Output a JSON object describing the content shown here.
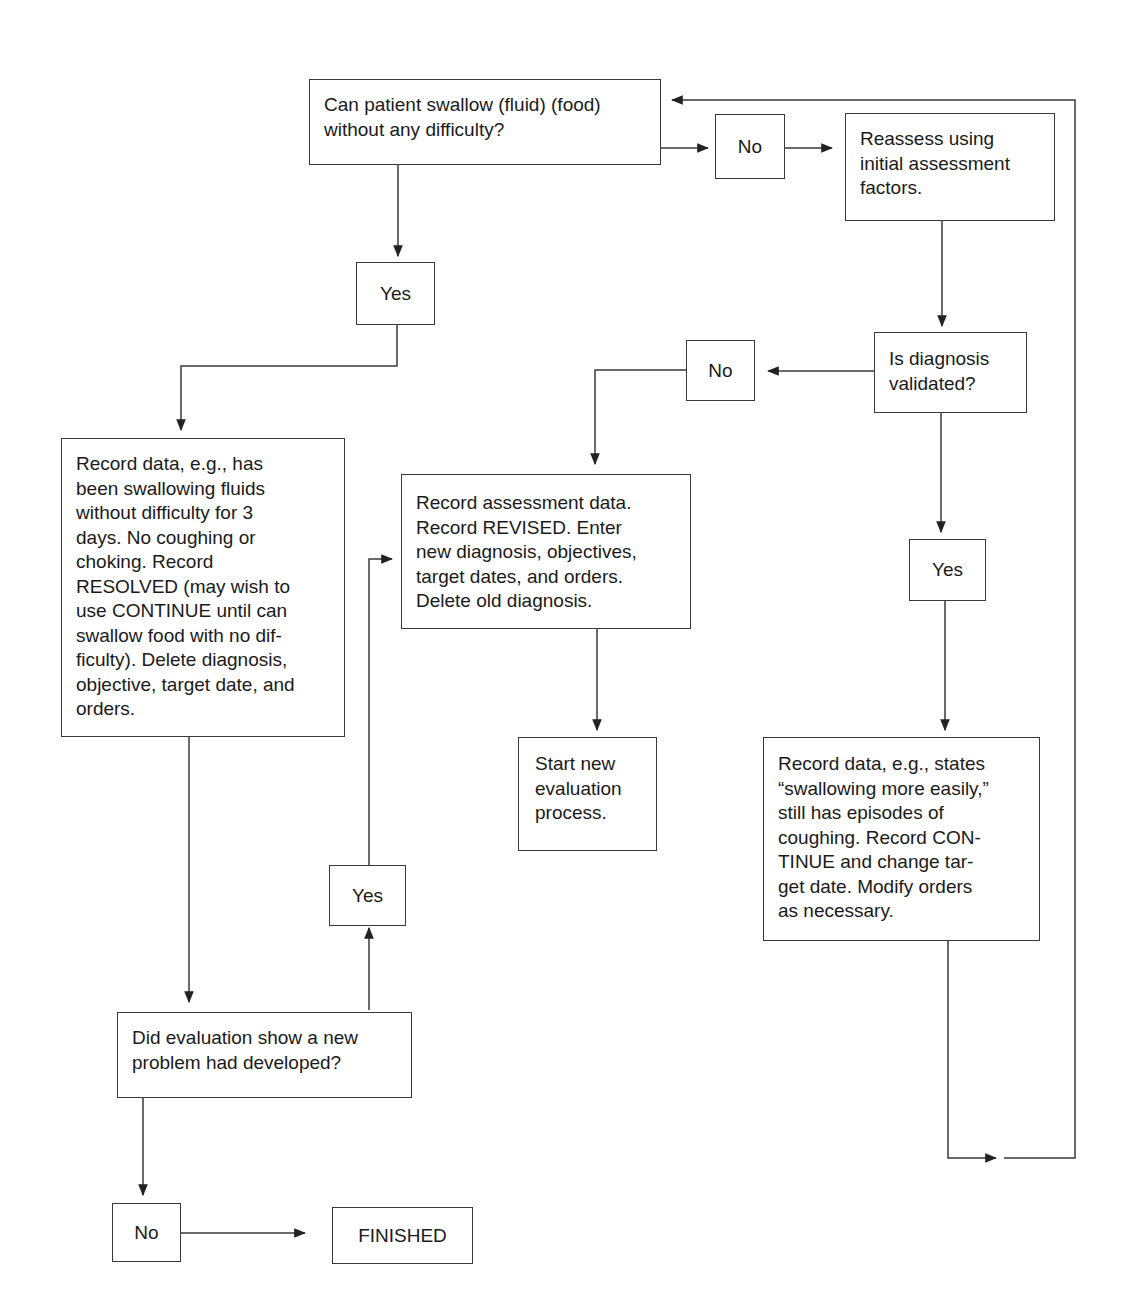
{
  "diagram": {
    "type": "flowchart",
    "topic": "Evaluation of swallowing difficulty nursing diagnosis",
    "nodes": {
      "q_swallow": "Can patient swallow (fluid) (food)\nwithout any difficulty?",
      "no_1": "No",
      "reassess": "Reassess using\ninitial assessment\nfactors.",
      "yes_1": "Yes",
      "q_validated": "Is diagnosis\nvalidated?",
      "no_2": "No",
      "record_resolved": "Record data, e.g., has\nbeen swallowing fluids\nwithout difficulty for 3\ndays. No coughing or\nchoking. Record\nRESOLVED (may wish to\nuse CONTINUE until can\nswallow food with no dif-\nficulty). Delete diagnosis,\nobjective, target date, and\norders.",
      "record_revised": "Record assessment data.\nRecord REVISED. Enter\nnew diagnosis, objectives,\ntarget dates, and orders.\nDelete old diagnosis.",
      "yes_2": "Yes",
      "start_new": "Start new\nevaluation\nprocess.",
      "record_continue": "Record data, e.g., states\n“swallowing more easily,”\nstill has episodes of\ncoughing. Record CON-\nTINUE and change tar-\nget date. Modify orders\nas necessary.",
      "yes_3": "Yes",
      "q_new_problem": "Did evaluation show a new\nproblem had developed?",
      "no_3": "No",
      "finished": "FINISHED"
    },
    "edges": [
      {
        "from": "q_swallow",
        "to": "no_1"
      },
      {
        "from": "no_1",
        "to": "reassess"
      },
      {
        "from": "q_swallow",
        "to": "yes_1"
      },
      {
        "from": "yes_1",
        "to": "record_resolved"
      },
      {
        "from": "reassess",
        "to": "q_validated"
      },
      {
        "from": "q_validated",
        "to": "no_2"
      },
      {
        "from": "no_2",
        "to": "record_revised"
      },
      {
        "from": "q_validated",
        "to": "yes_2"
      },
      {
        "from": "yes_2",
        "to": "record_continue"
      },
      {
        "from": "record_revised",
        "to": "start_new"
      },
      {
        "from": "record_continue",
        "to": "q_swallow",
        "note": "loop back"
      },
      {
        "from": "record_resolved",
        "to": "q_new_problem"
      },
      {
        "from": "q_new_problem",
        "to": "yes_3"
      },
      {
        "from": "yes_3",
        "to": "record_revised"
      },
      {
        "from": "q_new_problem",
        "to": "no_3"
      },
      {
        "from": "no_3",
        "to": "finished"
      }
    ],
    "colors": {
      "line": "#3a3a3a",
      "text": "#1a1a1a",
      "background": "#ffffff"
    }
  }
}
